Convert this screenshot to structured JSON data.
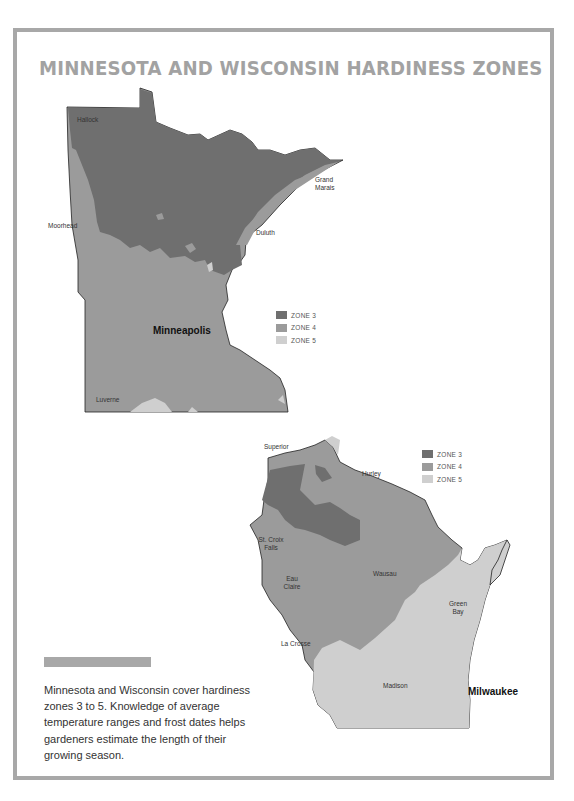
{
  "title": "MINNESOTA AND WISCONSIN HARDINESS ZONES",
  "colors": {
    "frame": "#a8a8a8",
    "title": "#a2a2a2",
    "zone3": "#6f6f6f",
    "zone4": "#9b9b9b",
    "zone5": "#cfcfcf"
  },
  "minnesota": {
    "legend": [
      {
        "label": "ZONE 3",
        "color": "#6f6f6f"
      },
      {
        "label": "ZONE 4",
        "color": "#9b9b9b"
      },
      {
        "label": "ZONE 5",
        "color": "#cfcfcf"
      }
    ],
    "cities": [
      {
        "name": "Hallock"
      },
      {
        "name": "Grand Marais"
      },
      {
        "name": "Moorhead"
      },
      {
        "name": "Duluth"
      },
      {
        "name": "Minneapolis",
        "emphasis": true
      },
      {
        "name": "Luverne"
      }
    ]
  },
  "wisconsin": {
    "legend": [
      {
        "label": "ZONE 3",
        "color": "#6f6f6f"
      },
      {
        "label": "ZONE 4",
        "color": "#9b9b9b"
      },
      {
        "label": "ZONE 5",
        "color": "#cfcfcf"
      }
    ],
    "cities": [
      {
        "name": "Superior"
      },
      {
        "name": "Hurley"
      },
      {
        "name": "St. Croix Falls"
      },
      {
        "name": "Eau Claire"
      },
      {
        "name": "Wausau"
      },
      {
        "name": "Green Bay"
      },
      {
        "name": "La Crosse"
      },
      {
        "name": "Madison"
      },
      {
        "name": "Milwaukee",
        "emphasis": true
      }
    ]
  },
  "caption": {
    "text": "Minnesota and Wisconsin cover hardiness zones 3 to 5. Knowledge of average temperature ranges and frost dates helps gardeners estimate the length of their growing season."
  }
}
